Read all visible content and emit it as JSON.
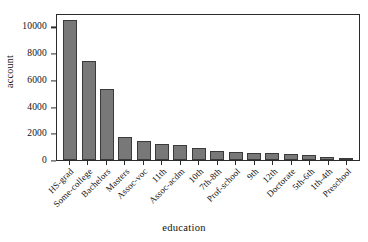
{
  "chart_data": {
    "type": "bar",
    "title": "",
    "xlabel": "education",
    "ylabel": "account",
    "categories": [
      "HS-grad",
      "Some-college",
      "Bachelors",
      "Masters",
      "Assoc-voc",
      "11th",
      "Assoc-acdm",
      "10th",
      "7th-8th",
      "Prof-school",
      "9th",
      "12th",
      "Doctorate",
      "5th-6th",
      "1th-4th",
      "Preschool"
    ],
    "values": [
      10500,
      7400,
      5350,
      1750,
      1400,
      1180,
      1100,
      930,
      650,
      580,
      510,
      490,
      420,
      340,
      230,
      85
    ],
    "ylim": [
      0,
      11000
    ],
    "yticks": [
      0,
      2000,
      4000,
      6000,
      8000,
      10000
    ],
    "ytick_labels": [
      "0",
      "2000",
      "4000",
      "6000",
      "8000",
      "10000"
    ],
    "grid": false,
    "legend": "none",
    "bar_color": "#787878",
    "bar_edge_color": "#3a3a3a",
    "frame_color": "#2b2b2b"
  }
}
